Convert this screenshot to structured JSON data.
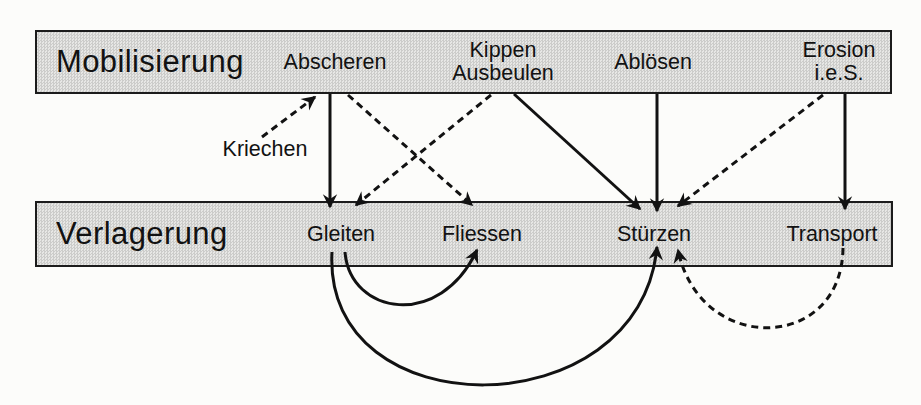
{
  "diagram": {
    "colors": {
      "page-bg": "#fcfcfa",
      "bar-fill": "#dededb",
      "bar-border": "#1c1c1c",
      "ink": "#121212"
    },
    "rows": [
      {
        "title": "Mobilisierung",
        "items": [
          {
            "id": "abscheren",
            "label": "Abscheren"
          },
          {
            "id": "kippen-ausbeulen",
            "label": "Kippen\nAusbeulen"
          },
          {
            "id": "abloesen",
            "label": "Ablösen"
          },
          {
            "id": "erosion",
            "label": "Erosion\ni.e.S."
          }
        ]
      },
      {
        "title": "Verlagerung",
        "items": [
          {
            "id": "gleiten",
            "label": "Gleiten"
          },
          {
            "id": "fliessen",
            "label": "Fliessen"
          },
          {
            "id": "stuerzen",
            "label": "Stürzen"
          },
          {
            "id": "transport",
            "label": "Transport"
          }
        ]
      }
    ],
    "floating": {
      "kriechen": "Kriechen"
    },
    "edges": [
      {
        "from": "kriechen",
        "to": "abscheren",
        "style": "dashed",
        "path": "M262,137 L315,97"
      },
      {
        "from": "abscheren",
        "to": "gleiten",
        "style": "solid",
        "path": "M330,94 L330,207"
      },
      {
        "from": "abscheren",
        "to": "fliessen",
        "style": "dashed",
        "path": "M348,95 L472,205"
      },
      {
        "from": "kippen-ausbeulen",
        "to": "gleiten",
        "style": "dashed",
        "path": "M491,95 L356,205"
      },
      {
        "from": "kippen-ausbeulen",
        "to": "stuerzen",
        "style": "solid",
        "path": "M514,94 L640,209"
      },
      {
        "from": "abloesen",
        "to": "stuerzen",
        "style": "solid",
        "path": "M657,94 L657,211"
      },
      {
        "from": "erosion",
        "to": "stuerzen",
        "style": "dashed",
        "path": "M823,95 L678,206"
      },
      {
        "from": "erosion",
        "to": "transport",
        "style": "solid",
        "path": "M845,94 L845,209"
      },
      {
        "from": "gleiten",
        "to": "fliessen",
        "style": "solid",
        "path": "M345,252 C350,315 440,330 477,250"
      },
      {
        "from": "gleiten",
        "to": "stuerzen",
        "style": "solid",
        "path": "M332,252 C322,430 640,430 657,247"
      },
      {
        "from": "transport",
        "to": "stuerzen",
        "style": "dashed",
        "path": "M843,248 C842,352 700,356 678,250"
      }
    ]
  }
}
